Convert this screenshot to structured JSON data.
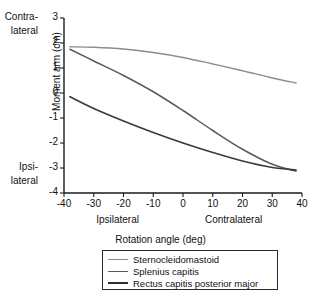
{
  "chart_data": {
    "type": "line",
    "title": "",
    "xlabel": "Rotation angle (deg)",
    "ylabel": "Moment arm (cm)",
    "xlim": [
      -40,
      40
    ],
    "ylim": [
      -4,
      3
    ],
    "xticks": [
      "-40",
      "-30",
      "-20",
      "-10",
      "0",
      "10",
      "20",
      "30",
      "40"
    ],
    "xtick_values": [
      -40,
      -30,
      -20,
      -10,
      0,
      10,
      20,
      30,
      40
    ],
    "yticks": [
      "3",
      "2",
      "1",
      "0",
      "-1",
      "-2",
      "-3",
      "-4"
    ],
    "ytick_values": [
      3,
      2,
      1,
      0,
      -1,
      -2,
      -3,
      -4
    ],
    "grid": false,
    "legend_position": "below-axis",
    "x": [
      -38,
      -30,
      -20,
      -10,
      0,
      10,
      20,
      30,
      38
    ],
    "series": [
      {
        "name": "Sternocleidomastoid",
        "color": "#8c8c8c",
        "width": 1.3,
        "values": [
          1.85,
          1.83,
          1.76,
          1.62,
          1.42,
          1.16,
          0.89,
          0.6,
          0.4
        ]
      },
      {
        "name": "Splenius capitis",
        "color": "#5a5a5a",
        "width": 1.5,
        "values": [
          1.75,
          1.28,
          0.7,
          0.05,
          -0.7,
          -1.5,
          -2.25,
          -2.85,
          -3.12
        ]
      },
      {
        "name": "Rectus capitis posterior major",
        "color": "#3a3a3a",
        "width": 1.7,
        "values": [
          -0.15,
          -0.62,
          -1.12,
          -1.58,
          -2.0,
          -2.38,
          -2.72,
          -2.98,
          -3.08
        ]
      }
    ],
    "y_axis_annotations": [
      {
        "id": "contralateral",
        "lines": [
          "Contra-",
          "lateral"
        ],
        "near_ticks": [
          3,
          2
        ]
      },
      {
        "id": "ipsilateral",
        "lines": [
          "Ipsi-",
          "lateral"
        ],
        "near_ticks": [
          -3,
          -4
        ]
      }
    ],
    "x_axis_annotations": [
      {
        "id": "ipsilateral-side",
        "text": "Ipsilateral",
        "at": -22
      },
      {
        "id": "contralateral-side",
        "text": "Contralateral",
        "at": 17
      }
    ]
  },
  "legend": {
    "entries": [
      {
        "label": "Sternocleidomastoid",
        "color": "#8c8c8c",
        "width": 1.3
      },
      {
        "label": "Splenius capitis",
        "color": "#5a5a5a",
        "width": 1.8
      },
      {
        "label": "Rectus capitis posterior major",
        "color": "#2f2f2f",
        "width": 2.3
      }
    ]
  },
  "axis_color": "#1a1a1a"
}
